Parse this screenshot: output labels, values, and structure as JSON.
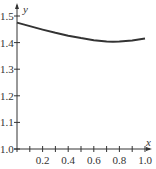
{
  "chart_data": {
    "type": "line",
    "title": "",
    "xlabel": "x",
    "ylabel": "y",
    "xlim": [
      0,
      1.0
    ],
    "ylim": [
      1.0,
      1.5
    ],
    "grid": false,
    "x_ticks": [
      "0.2",
      "0.4",
      "0.6",
      "0.8",
      "1.0"
    ],
    "y_ticks": [
      "1.0",
      "1.1",
      "1.2",
      "1.3",
      "1.4",
      "1.5"
    ],
    "series": [
      {
        "name": "curve",
        "color": "#333333",
        "x": [
          0,
          0.1,
          0.2,
          0.3,
          0.4,
          0.5,
          0.6,
          0.7,
          0.75,
          0.8,
          0.9,
          1.0
        ],
        "y": [
          1.475,
          1.462,
          1.449,
          1.437,
          1.426,
          1.417,
          1.409,
          1.404,
          1.403,
          1.404,
          1.408,
          1.415
        ]
      }
    ]
  }
}
